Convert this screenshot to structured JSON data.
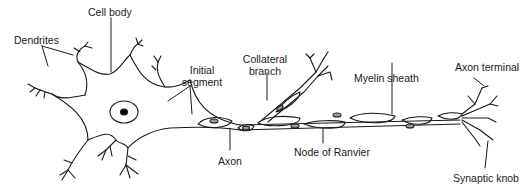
{
  "labels": {
    "cell_body": "Cell body",
    "dendrites": "Dendrites",
    "initial_segment_1": "Initial",
    "initial_segment_2": "segment",
    "collateral_1": "Collateral",
    "collateral_2": "branch",
    "myelin_sheath": "Myelin sheath",
    "axon_terminal": "Axon terminal",
    "axon": "Axon",
    "node_of_ranvier": "Node of Ranvier",
    "synaptic_knob": "Synaptic knob"
  },
  "colors": {
    "ink": "#1a1a1a",
    "background": "#ffffff",
    "nucleolus": "#000000"
  }
}
